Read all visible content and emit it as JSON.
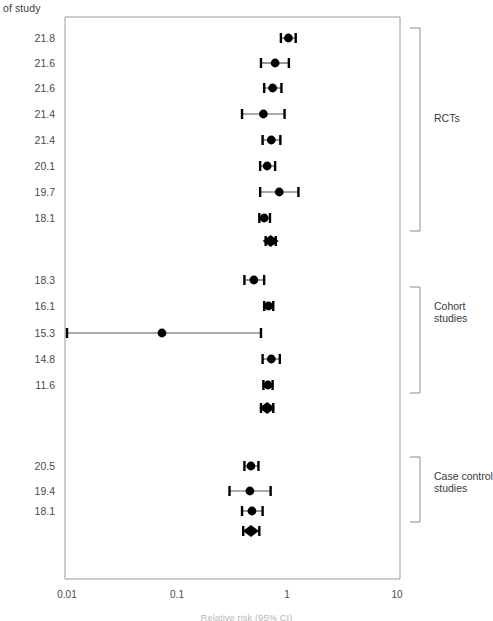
{
  "header": {
    "col_header": "of study"
  },
  "axis": {
    "ticks": [
      {
        "label": "0.01",
        "value": 0.01
      },
      {
        "label": "0.1",
        "value": 0.1
      },
      {
        "label": "1",
        "value": 1
      },
      {
        "label": "10",
        "value": 10
      }
    ],
    "title": "Relative risk (95% CI)",
    "scale": "log",
    "xlim": [
      0.01,
      10
    ]
  },
  "groups": [
    {
      "name": "RCTs",
      "label": "RCTs"
    },
    {
      "name": "Cohort studies",
      "label": "Cohort studies"
    },
    {
      "name": "Case control studies",
      "label": "Case control studies"
    }
  ],
  "chart_data": {
    "type": "forest",
    "title": "",
    "xlabel": "Relative risk (95% CI)",
    "ylabel": "",
    "xscale": "log",
    "xlim": [
      0.01,
      10
    ],
    "xticks": [
      0.01,
      0.1,
      1,
      10
    ],
    "xticklabels": [
      "0.01",
      "0.1",
      "1",
      "10"
    ],
    "row_label_header": "of study",
    "grid": false,
    "legend": "none",
    "groups": [
      {
        "name": "RCTs",
        "rows": [
          {
            "label": "21.8",
            "estimate": 1.03,
            "lower": 0.88,
            "upper": 1.2,
            "type": "study"
          },
          {
            "label": "21.6",
            "estimate": 0.78,
            "lower": 0.58,
            "upper": 1.04,
            "type": "study"
          },
          {
            "label": "21.6",
            "estimate": 0.74,
            "lower": 0.62,
            "upper": 0.89,
            "type": "study"
          },
          {
            "label": "21.4",
            "estimate": 0.61,
            "lower": 0.39,
            "upper": 0.95,
            "type": "study"
          },
          {
            "label": "21.4",
            "estimate": 0.72,
            "lower": 0.6,
            "upper": 0.87,
            "type": "study"
          },
          {
            "label": "20.1",
            "estimate": 0.66,
            "lower": 0.57,
            "upper": 0.78,
            "type": "study"
          },
          {
            "label": "19.7",
            "estimate": 0.85,
            "lower": 0.57,
            "upper": 1.27,
            "type": "study"
          },
          {
            "label": "18.1",
            "estimate": 0.62,
            "lower": 0.56,
            "upper": 0.7,
            "type": "study"
          },
          {
            "label": "",
            "estimate": 0.71,
            "lower": 0.64,
            "upper": 0.79,
            "type": "summary"
          }
        ]
      },
      {
        "name": "Cohort studies",
        "rows": [
          {
            "label": "18.3",
            "estimate": 0.5,
            "lower": 0.41,
            "upper": 0.62,
            "type": "study"
          },
          {
            "label": "16.1",
            "estimate": 0.68,
            "lower": 0.62,
            "upper": 0.75,
            "type": "study"
          },
          {
            "label": "15.3",
            "estimate": 0.073,
            "lower": 0.01,
            "upper": 0.58,
            "type": "study"
          },
          {
            "label": "14.8",
            "estimate": 0.72,
            "lower": 0.6,
            "upper": 0.86,
            "type": "study"
          },
          {
            "label": "11.6",
            "estimate": 0.67,
            "lower": 0.61,
            "upper": 0.74,
            "type": "study"
          },
          {
            "label": "",
            "estimate": 0.66,
            "lower": 0.58,
            "upper": 0.75,
            "type": "summary"
          }
        ]
      },
      {
        "name": "Case control studies",
        "rows": [
          {
            "label": "20.5",
            "estimate": 0.47,
            "lower": 0.41,
            "upper": 0.55,
            "type": "study"
          },
          {
            "label": "19.4",
            "estimate": 0.46,
            "lower": 0.3,
            "upper": 0.71,
            "type": "study"
          },
          {
            "label": "18.1",
            "estimate": 0.48,
            "lower": 0.39,
            "upper": 0.6,
            "type": "study"
          },
          {
            "label": "",
            "estimate": 0.47,
            "lower": 0.4,
            "upper": 0.56,
            "type": "summary"
          }
        ]
      }
    ]
  }
}
